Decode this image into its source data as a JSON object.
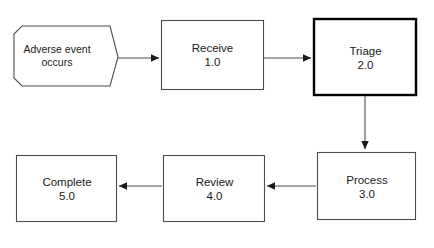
{
  "diagram": {
    "background_color": "#ffffff",
    "stroke_color": "#4d4d4d",
    "emphasis_stroke_color": "#000000",
    "text_color": "#1a1a1a",
    "nodes": [
      {
        "id": "terminator",
        "shape": "pentagon-arrow",
        "line1": "Adverse event",
        "line2": "occurs",
        "emphasis": false
      },
      {
        "id": "receive",
        "shape": "rectangle",
        "line1": "Receive",
        "line2": "1.0",
        "emphasis": false
      },
      {
        "id": "triage",
        "shape": "rectangle",
        "line1": "Triage",
        "line2": "2.0",
        "emphasis": true
      },
      {
        "id": "process",
        "shape": "rectangle",
        "line1": "Process",
        "line2": "3.0",
        "emphasis": false
      },
      {
        "id": "review",
        "shape": "rectangle",
        "line1": "Review",
        "line2": "4.0",
        "emphasis": false
      },
      {
        "id": "complete",
        "shape": "rectangle",
        "line1": "Complete",
        "line2": "5.0",
        "emphasis": false
      }
    ],
    "edges": [
      {
        "id": "terminator-to-receive",
        "from": "terminator",
        "to": "receive",
        "direction": "right",
        "label": ""
      },
      {
        "id": "receive-to-triage",
        "from": "receive",
        "to": "triage",
        "direction": "right",
        "label": ""
      },
      {
        "id": "triage-to-process",
        "from": "triage",
        "to": "process",
        "direction": "down",
        "label": ""
      },
      {
        "id": "process-to-review",
        "from": "process",
        "to": "review",
        "direction": "left",
        "label": ""
      },
      {
        "id": "review-to-complete",
        "from": "review",
        "to": "complete",
        "direction": "left",
        "label": ""
      }
    ]
  }
}
